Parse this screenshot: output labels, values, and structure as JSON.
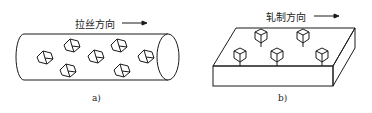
{
  "panels": [
    {
      "id": "a",
      "shape": "cylinder",
      "direction_label": "拉丝方向",
      "caption": "a)",
      "crystal_count": 7
    },
    {
      "id": "b",
      "shape": "slab",
      "direction_label": "轧制方向",
      "caption": "b)",
      "crystal_count": 5
    }
  ],
  "colors": {
    "line": "#1a1a1a",
    "background": "#ffffff"
  }
}
